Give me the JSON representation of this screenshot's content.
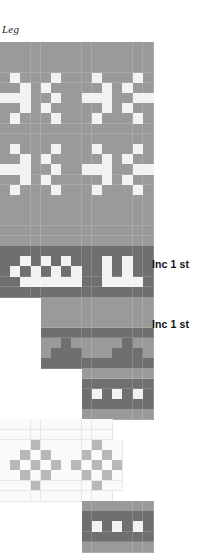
{
  "title": "Leg",
  "chart_meta": {
    "type": "knitting-colorwork-chart",
    "cell_width": 10.2,
    "cell_height": 10.2,
    "origin_x": 0,
    "origin_y": 42,
    "columns": 15,
    "rows": 49
  },
  "palette": {
    "background": "#ffffff",
    "main_gray": "#9a9a9a",
    "dark_gray": "#6f6f6f",
    "light_gray": "#b8b8b8",
    "white_stitch": "#f2f2f2",
    "pale_panel": "#fafafa",
    "gridline": "#e8e8e8",
    "text": "#111111"
  },
  "annotations": [
    {
      "label": "Inc 1 st",
      "x": 152,
      "y": 258
    },
    {
      "label": "Inc 1 st",
      "x": 152,
      "y": 318
    }
  ],
  "chart_data": {
    "type": "heatmap",
    "title": "Leg",
    "xlabel": "",
    "ylabel": "",
    "legend": [
      "main_gray",
      "dark_gray",
      "light_gray",
      "white_stitch",
      "pale_panel"
    ],
    "cell_size": 10.2,
    "columns": 15,
    "note": "Each row string has 15 chars. Key: '.'=empty/background, 'M'=main gray, 'D'=dark gray, 'W'=white stitch, 'P'=pale panel, 'L'=light gray motif",
    "rows": [
      "MMMMMMMMMMMMMMM",
      "MMMMMMMMMMMMMMM",
      "MMMMMMMMMMMMMMM",
      "MWMMMWMMMWMMMWM",
      "MMWMWMMMMMWMWMM",
      "WWWMMWMMWWWMMWW",
      "MMWMWMMMMMWMWMM",
      "MWMMMWMMMWMMMWM",
      "MMMMMMMMMMMMMMM",
      "MMMMMMMMMMMMMMM",
      "MWMMMWMMMWMMMWM",
      "MMWMWMMMMMWMWMM",
      "WWWMMWMMWWWMMWW",
      "MMWMWMMMMMWMWMM",
      "MWMMMWMMMWMMMWM",
      "MMMMMMMMMMMMMMM",
      "MMMMMMMMMMMMMMM",
      "MMMMMMMMMMMMMMM",
      "MMMMMMMMMMMMMMM",
      "MMMMMMMMMMMMMMM",
      "DDDDDDDDDDDDDDD",
      "DDWDWDWDDDWDWDD",
      "DWDWDWDWDDWDWDD",
      "DDWWWWWWDDWWWWD",
      "DDDDDDDDDDDDDDD",
      "....MMMMMMMMMMM",
      "....MMMMMMMMMMM",
      "....MMMMMMMMMMM",
      "....DDDDDDDDDDD",
      "....MMDMMMMMDMM",
      "....MDDDMMMDDDM",
      "....DDDDDDDDDDD",
      "........MMMMMMM",
      "........DDDDDDD",
      "........DWDWDWD",
      "........DDDDDDD",
      "........MMMMMMM",
      "PPPPPPPPPPP....",
      "PPPPPPPPPPP....",
      "PPPLPPPPPLPP...",
      "PPLPLPPPLPLP...",
      "PLPLPLPLPLPL...",
      "PPLPLPPPLPLP...",
      "PPPLPPPPPLPP...",
      "PPPPPPPPPPP....",
      "........MMMMMMM",
      "........DDDDDDD",
      "........DWDWDWD",
      "........DDDDDDD",
      "........MMMMMMM"
    ]
  }
}
